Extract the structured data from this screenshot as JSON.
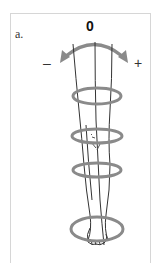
{
  "figure": {
    "panel_label": "a.",
    "center_label": "0",
    "negative_label": "–",
    "positive_label": "+",
    "rotation_arrow_color": "#8a8a8a",
    "ring_color": "#8a8a8a",
    "leg_line_color": "#333333",
    "frame_color": "#d6d6d6",
    "ring_count": 5
  }
}
